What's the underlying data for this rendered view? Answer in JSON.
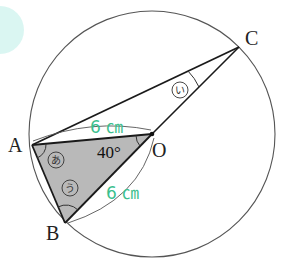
{
  "diagram": {
    "colors": {
      "accent_blob": "#d4f5f0",
      "circle_stroke": "#555555",
      "line_stroke": "#1a1a1a",
      "triangle_fill": "#b9b9b9",
      "length_label": "#3cbf8e"
    },
    "circle": {
      "center": "O",
      "cx": 152,
      "cy": 134,
      "r": 123
    },
    "points": {
      "A": {
        "label": "A",
        "x": 32,
        "y": 145
      },
      "B": {
        "label": "B",
        "x": 65,
        "y": 223
      },
      "C": {
        "label": "C",
        "x": 239,
        "y": 47
      },
      "O": {
        "label": "O",
        "x": 152,
        "y": 134
      }
    },
    "labels": {
      "A": "A",
      "B": "B",
      "C": "C",
      "O": "O",
      "angle_AOB": "40°",
      "length_OA": "6 ㎝",
      "length_OB": "6 ㎝"
    },
    "angle_marks": {
      "a": "あ",
      "i": "い",
      "u": "う"
    },
    "segments": [
      "AC",
      "CO",
      "OB",
      "AO",
      "AB"
    ],
    "shaded_triangle": "AOB"
  }
}
